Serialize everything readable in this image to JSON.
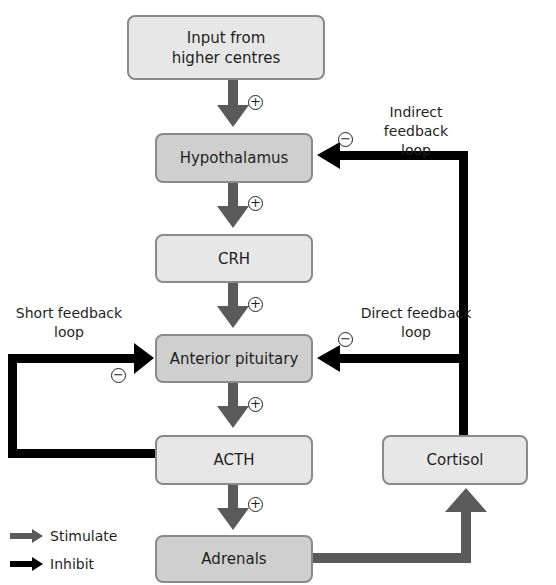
{
  "diagram": {
    "type": "flowchart",
    "nodes": {
      "input": "Input from higher centres",
      "input_line1": "Input from",
      "input_line2": "higher centres",
      "hypothalamus": "Hypothalamus",
      "crh": "CRH",
      "anterior_pituitary": "Anterior pituitary",
      "acth": "ACTH",
      "adrenals": "Adrenals",
      "cortisol": "Cortisol"
    },
    "edges": [
      {
        "from": "Input from higher centres",
        "to": "Hypothalamus",
        "type": "stimulate",
        "sign": "+"
      },
      {
        "from": "Hypothalamus",
        "to": "CRH",
        "type": "stimulate",
        "sign": "+"
      },
      {
        "from": "CRH",
        "to": "Anterior pituitary",
        "type": "stimulate",
        "sign": "+"
      },
      {
        "from": "Anterior pituitary",
        "to": "ACTH",
        "type": "stimulate",
        "sign": "+"
      },
      {
        "from": "ACTH",
        "to": "Adrenals",
        "type": "stimulate",
        "sign": "+"
      },
      {
        "from": "Adrenals",
        "to": "Cortisol",
        "type": "stimulate"
      },
      {
        "from": "Cortisol",
        "to": "Hypothalamus",
        "type": "inhibit",
        "sign": "−",
        "label": "Indirect feedback loop"
      },
      {
        "from": "Cortisol",
        "to": "Anterior pituitary",
        "type": "inhibit",
        "sign": "−",
        "label": "Direct feedback loop"
      },
      {
        "from": "ACTH",
        "to": "Anterior pituitary",
        "type": "inhibit",
        "sign": "−",
        "label": "Short feedback loop"
      }
    ],
    "loop_labels": {
      "indirect_l1": "Indirect feedback",
      "indirect_l2": "loop",
      "direct_l1": "Direct feedback",
      "direct_l2": "loop",
      "short_l1": "Short feedback",
      "short_l2": "loop"
    },
    "signs": {
      "plus": "+",
      "minus": "−"
    },
    "legend": {
      "stimulate": "Stimulate",
      "inhibit": "Inhibit"
    },
    "colors": {
      "stimulate_arrow": "#5a5a5a",
      "inhibit_arrow": "#000000",
      "box_light": "#e7e7e7",
      "box_mid": "#cfcfcf",
      "box_border": "#8a8a8a"
    }
  }
}
